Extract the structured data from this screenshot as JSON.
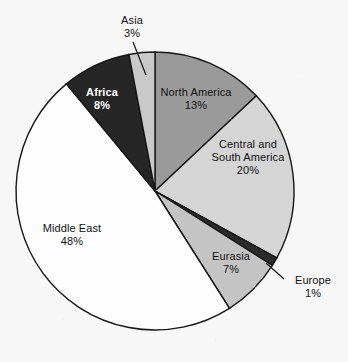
{
  "chart_data": {
    "type": "pie",
    "title": "",
    "subtitle": "",
    "xlabel": "",
    "ylabel": "",
    "legend_position": "none",
    "grid": false,
    "labels_outside": [
      "Asia",
      "Europe"
    ],
    "start_angle_deg": 0,
    "direction": "clockwise",
    "categories": [
      "North America",
      "Central and South America",
      "Europe",
      "Eurasia",
      "Middle East",
      "Africa",
      "Asia"
    ],
    "values": [
      13,
      20,
      1,
      7,
      48,
      8,
      3
    ],
    "unit": "%",
    "slices": [
      {
        "name": "North America",
        "name_line1": "North America",
        "name_line2": "",
        "value": 13,
        "value_label": "13%",
        "color": "#9a9a9a",
        "text_color": "#121212",
        "bold": false,
        "leader": false
      },
      {
        "name": "Central and South America",
        "name_line1": "Central and",
        "name_line2": "South America",
        "value": 20,
        "value_label": "20%",
        "color": "#d5d5d5",
        "text_color": "#121212",
        "bold": false,
        "leader": false
      },
      {
        "name": "Europe",
        "name_line1": "Europe",
        "name_line2": "",
        "value": 1,
        "value_label": "1%",
        "color": "#2b2b2b",
        "text_color": "#121212",
        "bold": false,
        "leader": true
      },
      {
        "name": "Eurasia",
        "name_line1": "Eurasia",
        "name_line2": "",
        "value": 7,
        "value_label": "7%",
        "color": "#c4c4c4",
        "text_color": "#121212",
        "bold": false,
        "leader": false
      },
      {
        "name": "Middle East",
        "name_line1": "Middle East",
        "name_line2": "",
        "value": 48,
        "value_label": "48%",
        "color": "#fdfdfd",
        "text_color": "#121212",
        "bold": false,
        "leader": false
      },
      {
        "name": "Africa",
        "name_line1": "Africa",
        "name_line2": "",
        "value": 8,
        "value_label": "8%",
        "color": "#262626",
        "text_color": "#ffffff",
        "bold": true,
        "leader": false
      },
      {
        "name": "Asia",
        "name_line1": "Asia",
        "name_line2": "",
        "value": 3,
        "value_label": "3%",
        "color": "#c9c9c9",
        "text_color": "#121212",
        "bold": false,
        "leader": true
      }
    ]
  },
  "style": {
    "background": "#f7f7f7",
    "outline": "#161616",
    "center_x": 155,
    "center_y": 191,
    "radius": 139
  }
}
